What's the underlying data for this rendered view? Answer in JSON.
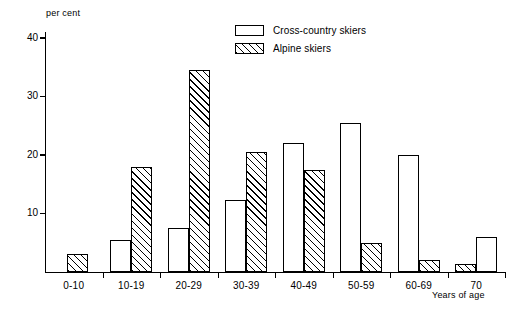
{
  "chart_data": {
    "type": "bar",
    "title": "",
    "xlabel": "Years of age",
    "ylabel": "per cent",
    "categories": [
      "0-10",
      "10-19",
      "20-29",
      "30-39",
      "40-49",
      "50-59",
      "60-69",
      "70"
    ],
    "series": [
      {
        "name": "Cross-country skiers",
        "fill": "white",
        "values": [
          0,
          5.5,
          7.5,
          12.3,
          22.0,
          25.5,
          20.0,
          6.0
        ]
      },
      {
        "name": "Alpine skiers",
        "fill": "hatched",
        "values": [
          3.0,
          18.0,
          34.5,
          20.5,
          17.5,
          5.0,
          2.0,
          1.3
        ]
      }
    ],
    "ylim": [
      0,
      41
    ],
    "yticks": [
      10,
      20,
      30,
      40
    ],
    "ytick_labels": [
      "10",
      "20",
      "30",
      "40"
    ],
    "grid": false,
    "legend_position": "top-center"
  },
  "legend": {
    "entries": [
      {
        "label": "Cross-country skiers",
        "swatch": "white-rect"
      },
      {
        "label": "Alpine skiers",
        "swatch": "hatched-rect"
      }
    ]
  },
  "axes": {
    "y_unit_label": "per cent",
    "x_axis_label": "Years of age"
  },
  "colors": {
    "ink": "#000000",
    "paper": "#ffffff"
  }
}
